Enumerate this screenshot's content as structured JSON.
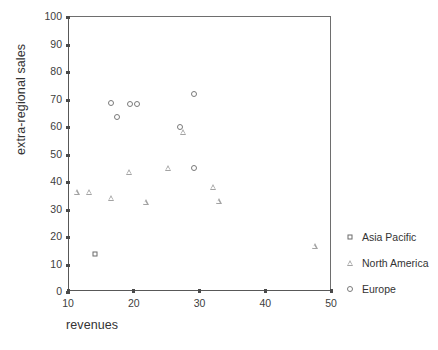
{
  "chart_data": {
    "type": "scatter",
    "title": "",
    "xlabel": "revenues",
    "ylabel": "extra-regional sales",
    "xlim": [
      10,
      50
    ],
    "ylim": [
      0,
      100
    ],
    "xticks": [
      10,
      20,
      30,
      40,
      50
    ],
    "yticks": [
      0,
      10,
      20,
      30,
      40,
      50,
      60,
      70,
      80,
      90,
      100
    ],
    "grid": false,
    "legend_position": "right",
    "series": [
      {
        "name": "Asia Pacific",
        "marker": "square",
        "color": "#6b6b6b",
        "points": [
          {
            "x": 14.1,
            "y": 13.5
          }
        ]
      },
      {
        "name": "North America",
        "marker": "triangle",
        "color": "#a3a3a3",
        "points": [
          {
            "x": 11.3,
            "y": 36.0
          },
          {
            "x": 13.2,
            "y": 36.0
          },
          {
            "x": 16.6,
            "y": 34.0
          },
          {
            "x": 19.3,
            "y": 43.2
          },
          {
            "x": 21.8,
            "y": 32.4
          },
          {
            "x": 25.2,
            "y": 44.9
          },
          {
            "x": 27.5,
            "y": 58.0
          },
          {
            "x": 32.0,
            "y": 38.0
          },
          {
            "x": 32.9,
            "y": 32.7
          },
          {
            "x": 47.5,
            "y": 16.5
          }
        ]
      },
      {
        "name": "Europe",
        "marker": "circle",
        "color": "#7a7a7a",
        "points": [
          {
            "x": 16.6,
            "y": 68.2
          },
          {
            "x": 17.4,
            "y": 63.3
          },
          {
            "x": 19.5,
            "y": 68.1
          },
          {
            "x": 20.5,
            "y": 68.1
          },
          {
            "x": 27.1,
            "y": 59.8
          },
          {
            "x": 29.2,
            "y": 71.8
          },
          {
            "x": 29.1,
            "y": 44.8
          }
        ]
      }
    ]
  },
  "legend": {
    "items": [
      {
        "label": "Asia Pacific",
        "marker": "square"
      },
      {
        "label": "North America",
        "marker": "triangle"
      },
      {
        "label": "Europe",
        "marker": "circle"
      }
    ]
  }
}
